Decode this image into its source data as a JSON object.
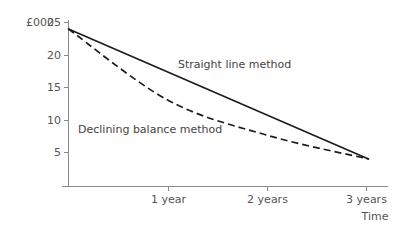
{
  "chart_data": {
    "type": "line",
    "title": "",
    "subtitle": "",
    "xlabel": "Time",
    "ylabel": "£000",
    "grid": false,
    "legend_position": "inline-annotation",
    "x": [
      0,
      1,
      2,
      3
    ],
    "xtick_labels": [
      "1 year",
      "2 years",
      "3 years"
    ],
    "xtick_values": [
      1,
      2,
      3
    ],
    "ytick_labels": [
      "25",
      "20",
      "15",
      "10",
      "5"
    ],
    "ytick_values": [
      25,
      20,
      15,
      10,
      5
    ],
    "xlim": [
      0,
      3.2
    ],
    "ylim": [
      0,
      25.8
    ],
    "series": [
      {
        "name": "Straight line method",
        "style": "solid",
        "color": "#1c1c1c",
        "values": [
          24,
          17.3,
          10.7,
          4
        ],
        "label_x": 1.07,
        "label_y": 19.5
      },
      {
        "name": "Declining balance method",
        "style": "dashed",
        "color": "#1c1c1c",
        "values": [
          24,
          13.0,
          7.6,
          4
        ],
        "label_x": 0.11,
        "label_y": 10.2
      }
    ]
  },
  "annotations": {
    "straight_line_label": "Straight line method",
    "declining_balance_label": "Declining balance method"
  },
  "axes": {
    "y_unit_label": "£000",
    "x_axis_title": "Time"
  },
  "colors": {
    "axis": "#8a8a8a",
    "series": "#1c1c1c",
    "text": "#555555",
    "background": "#ffffff"
  }
}
